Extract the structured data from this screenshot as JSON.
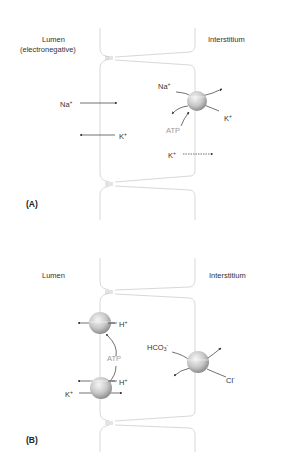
{
  "panels": [
    {
      "id": "A",
      "label": "(A)",
      "lumen_label": "Lumen",
      "lumen_sublabel": "(electronegative)",
      "interstitium_label": "Interstitium",
      "ions": {
        "na_apical": "Na",
        "k_apical": "K",
        "na_pump": "Na",
        "k_pump": "K",
        "atp": "ATP",
        "k_channel": "K"
      },
      "charges": {
        "plus": "+"
      }
    },
    {
      "id": "B",
      "label": "(B)",
      "lumen_label": "Lumen",
      "interstitium_label": "Interstitium",
      "ions": {
        "h_top": "H",
        "atp": "ATP",
        "h_bottom": "H",
        "k_bottom": "K",
        "hco3_base": "HCO",
        "hco3_sub": "3",
        "cl": "Cl"
      },
      "charges": {
        "plus": "+",
        "minus": "-"
      }
    }
  ],
  "colors": {
    "membrane": "#d8d8d8",
    "arrow": "#333333",
    "atp": "#9a9a9a",
    "pump_light": "#f2f2f2",
    "pump_dark": "#9c9c9c"
  }
}
